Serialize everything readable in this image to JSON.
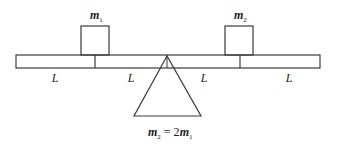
{
  "diagram": {
    "type": "seesaw-lever",
    "masses": [
      {
        "name": "m",
        "subscript": "1"
      },
      {
        "name": "m",
        "subscript": "2"
      }
    ],
    "segment_labels": [
      "L",
      "L",
      "L",
      "L"
    ],
    "relation": {
      "lhs_name": "m",
      "lhs_sub": "2",
      "eq": " = 2",
      "rhs_name": "m",
      "rhs_sub": "1"
    },
    "colors": {
      "stroke": "#3a3a3a",
      "background": "#ffffff"
    }
  }
}
